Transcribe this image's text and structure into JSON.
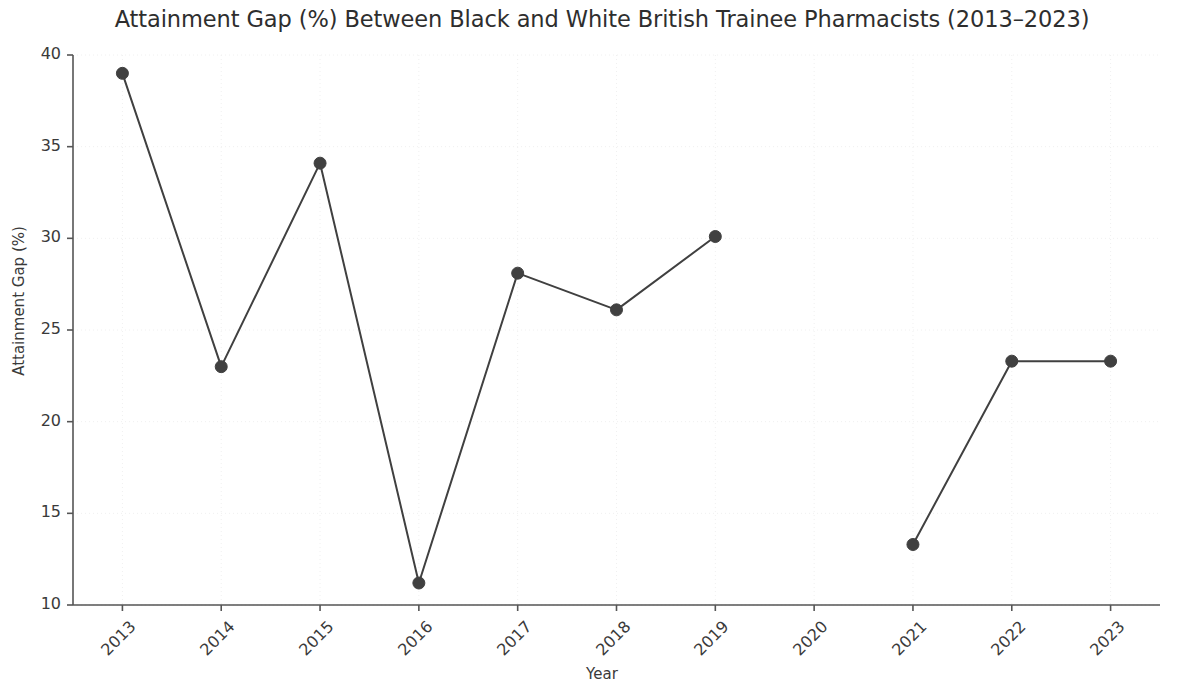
{
  "chart_data": {
    "type": "line",
    "title": "Attainment Gap (%) Between Black and White British Trainee Pharmacists (2013–2023)",
    "xlabel": "Year",
    "ylabel": "Attainment Gap (%)",
    "categories": [
      "2013",
      "2014",
      "2015",
      "2016",
      "2017",
      "2018",
      "2019",
      "2020",
      "2021",
      "2022",
      "2023"
    ],
    "x": [
      2013,
      2014,
      2015,
      2016,
      2017,
      2018,
      2019,
      2020,
      2021,
      2022,
      2023
    ],
    "values": [
      39.0,
      23.0,
      34.1,
      11.2,
      28.1,
      26.1,
      30.1,
      null,
      13.3,
      23.3,
      23.3
    ],
    "series": [
      {
        "name": "Attainment Gap (%)",
        "values": [
          39.0,
          23.0,
          34.1,
          11.2,
          28.1,
          26.1,
          30.1,
          null,
          13.3,
          23.3,
          23.3
        ]
      }
    ],
    "missing_points": [
      "2020"
    ],
    "xlim": [
      2012.5,
      2023.5
    ],
    "ylim": [
      10,
      40
    ],
    "yticks": [
      10,
      15,
      20,
      25,
      30,
      35,
      40
    ],
    "ytick_labels": [
      "10",
      "15",
      "20",
      "25",
      "30",
      "35",
      "40"
    ],
    "xticks": [
      2013,
      2014,
      2015,
      2016,
      2017,
      2018,
      2019,
      2020,
      2021,
      2022,
      2023
    ],
    "xtick_labels": [
      "2013",
      "2014",
      "2015",
      "2016",
      "2017",
      "2018",
      "2019",
      "2020",
      "2021",
      "2022",
      "2023"
    ],
    "xtick_rotation": -45,
    "grid": true,
    "grid_style": "dotted",
    "legend": null,
    "legend_position": "none",
    "line_color": "#404040",
    "marker_color": "#404040",
    "marker": "circle",
    "marker_size": 6,
    "line_width": 2,
    "grid_color": "#f0f0f0",
    "axis_color": "#555555",
    "background_color": "#ffffff"
  },
  "layout": {
    "plot_left": 73,
    "plot_right": 1160,
    "plot_top": 55,
    "plot_bottom": 605
  }
}
